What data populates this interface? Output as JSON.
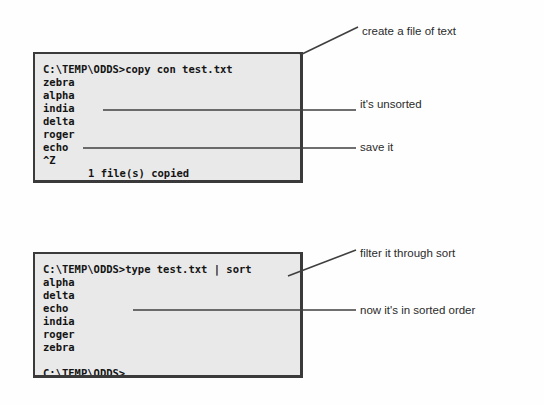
{
  "figure": {
    "kind": "dos-console-illustration",
    "page_background": "#fefefe",
    "console_background": "#e9e9e9",
    "console_border_color": "#3a3a3a",
    "text_color": "#141414",
    "annotation_color": "#2b2b2b",
    "leader_line_color": "#3f3f3f"
  },
  "console_create": {
    "name": "copy-con-console",
    "lines": [
      "C:\\TEMP\\ODDS>copy con test.txt",
      "zebra",
      "alpha",
      "india",
      "delta",
      "roger",
      "echo",
      "^Z"
    ],
    "status_line": "1 file(s) copied"
  },
  "console_sort": {
    "name": "type-sort-console",
    "command": "C:\\TEMP\\ODDS>type test.txt | sort",
    "output": [
      "alpha",
      "delta",
      "echo",
      "india",
      "roger",
      "zebra"
    ],
    "blank": " ",
    "final_prompt": "C:\\TEMP\\ODDS>"
  },
  "annotations": {
    "create": "create a file of text",
    "unsorted": "it's unsorted",
    "save": "save it",
    "filter": "filter it through sort",
    "sorted": "now it's in sorted order"
  }
}
